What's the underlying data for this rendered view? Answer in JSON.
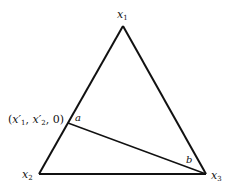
{
  "diagram": {
    "type": "ternary-simplex",
    "vertices": {
      "top": {
        "label": "x",
        "sub": "1"
      },
      "bottom_left": {
        "label": "x",
        "sub": "2"
      },
      "bottom_right": {
        "label": "x",
        "sub": "3"
      }
    },
    "point_on_edge": {
      "label_open": "(",
      "x1": "x′",
      "x1_sub": "1",
      "sep1": ", ",
      "x2": "x′",
      "x2_sub": "2",
      "tail": ", 0)"
    },
    "angles": {
      "at_point": "a",
      "at_x3": "b"
    },
    "colors": {
      "line": "#111111",
      "background": "#ffffff"
    }
  }
}
